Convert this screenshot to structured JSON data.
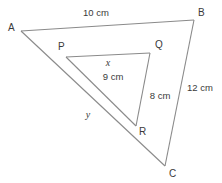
{
  "figure": {
    "stroke_color": "#8a8a8a",
    "text_color": "#3a3a3a",
    "background_color": "#ffffff"
  },
  "outer_triangle": {
    "name": "triangle-abc",
    "vertices": [
      {
        "id": "A",
        "label": "A",
        "x": 21,
        "y": 31,
        "label_x": 8,
        "label_y": 31
      },
      {
        "id": "B",
        "label": "B",
        "x": 194,
        "y": 20,
        "label_x": 198,
        "label_y": 16
      },
      {
        "id": "C",
        "label": "C",
        "x": 165,
        "y": 166,
        "label_x": 169,
        "label_y": 177
      }
    ],
    "sides": [
      {
        "id": "AB",
        "label": "10 cm",
        "label_x": 96,
        "label_y": 16
      },
      {
        "id": "BC",
        "label": "12 cm",
        "label_x": 200,
        "label_y": 91
      },
      {
        "id": "CA",
        "label": "y",
        "label_x": 88,
        "label_y": 118
      }
    ]
  },
  "inner_triangle": {
    "name": "triangle-pqr",
    "vertices": [
      {
        "id": "P",
        "label": "P",
        "x": 66,
        "y": 57,
        "label_x": 58,
        "label_y": 50
      },
      {
        "id": "Q",
        "label": "Q",
        "x": 150,
        "y": 53,
        "label_x": 155,
        "label_y": 48
      },
      {
        "id": "R",
        "label": "R",
        "x": 136,
        "y": 126,
        "label_x": 139,
        "label_y": 135
      }
    ],
    "sides": [
      {
        "id": "PQ",
        "label": "x",
        "label_x": 108,
        "label_y": 66
      },
      {
        "id": "QR",
        "label": "8 cm",
        "label_x": 147,
        "label_y": 99
      },
      {
        "id": "RP",
        "label": "9 cm",
        "label_x": 99,
        "label_y": 80
      }
    ]
  }
}
